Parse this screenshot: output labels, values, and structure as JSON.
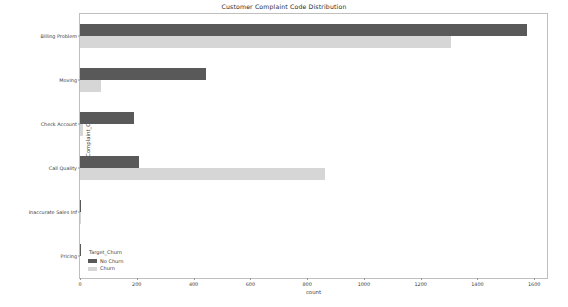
{
  "chart_data": {
    "type": "bar",
    "orientation": "horizontal",
    "grouped": true,
    "title": "Customer Complaint Code Distribution",
    "xlabel": "count",
    "ylabel": "Complaint_Code",
    "legend_title": "Target_Churn",
    "legend_position": "lower left (inside axes)",
    "grid": false,
    "xlim": [
      0,
      1645
    ],
    "xticks": [
      0,
      200,
      400,
      600,
      800,
      1000,
      1200,
      1400,
      1600
    ],
    "xticklabels": [
      "0",
      "200",
      "400",
      "600",
      "800",
      "1000",
      "1200",
      "1400",
      "1600"
    ],
    "categories": [
      "Billing Problem",
      "Moving",
      "Check Account",
      "Call Quality",
      "Inaccurate Sales Inf",
      "Pricing"
    ],
    "series": [
      {
        "name": "No Churn",
        "color": "#595959",
        "values": [
          1575,
          445,
          190,
          207,
          5,
          1
        ]
      },
      {
        "name": "Churn",
        "color": "#d6d6d6",
        "values": [
          1308,
          73,
          10,
          863,
          2,
          0
        ]
      }
    ]
  },
  "figure": {
    "background": "#ffffff",
    "axes_border_color": "#bfbfbf",
    "tick_color": "#9a9a9a",
    "text_color": "#3d3d3d"
  }
}
